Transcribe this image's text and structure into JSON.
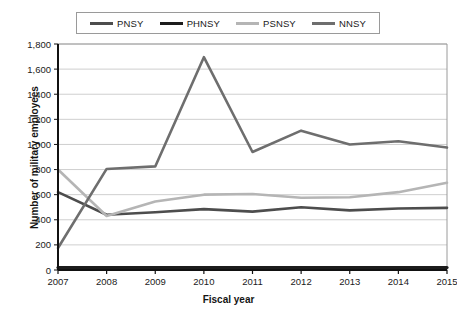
{
  "chart_data": {
    "type": "line",
    "title": "",
    "xlabel": "Fiscal year",
    "ylabel": "Number of military employees",
    "categories": [
      "2007",
      "2008",
      "2009",
      "2010",
      "2011",
      "2012",
      "2013",
      "2014",
      "2015"
    ],
    "x": [
      2007,
      2008,
      2009,
      2010,
      2011,
      2012,
      2013,
      2014,
      2015
    ],
    "ylim": [
      0,
      1800
    ],
    "ytick_values": [
      0,
      200,
      400,
      600,
      800,
      1000,
      1200,
      1400,
      1600,
      1800
    ],
    "ytick_labels": [
      "0",
      "200",
      "400",
      "600",
      "800",
      "1,000",
      "1,200",
      "1,400",
      "1,600",
      "1,800"
    ],
    "grid": true,
    "grid_axis": "y",
    "legend_position": "top",
    "series": [
      {
        "name": "PNSY",
        "color": "#4d4d4d",
        "values": [
          620,
          440,
          460,
          485,
          465,
          500,
          475,
          490,
          495
        ]
      },
      {
        "name": "PHNSY",
        "color": "#1c1c1c",
        "values": [
          20,
          20,
          20,
          20,
          20,
          20,
          20,
          20,
          20
        ]
      },
      {
        "name": "PSNSY",
        "color": "#b5b5b5",
        "values": [
          800,
          430,
          545,
          600,
          605,
          575,
          580,
          620,
          695
        ]
      },
      {
        "name": "NNSY",
        "color": "#6e6e6e",
        "values": [
          175,
          805,
          825,
          1695,
          940,
          1110,
          1000,
          1025,
          975
        ]
      }
    ]
  },
  "legend": {
    "items": [
      {
        "label": "PNSY",
        "color": "#4d4d4d"
      },
      {
        "label": "PHNSY",
        "color": "#1c1c1c"
      },
      {
        "label": "PSNSY",
        "color": "#b5b5b5"
      },
      {
        "label": "NNSY",
        "color": "#6e6e6e"
      }
    ]
  },
  "axes": {
    "y_title": "Number of military employees",
    "x_title": "Fiscal year"
  },
  "colors": {
    "axis": "#111111",
    "grid": "#cfcfcf",
    "plot_border": "#9a9a9a",
    "text": "#1a1a1a",
    "background": "#ffffff"
  }
}
